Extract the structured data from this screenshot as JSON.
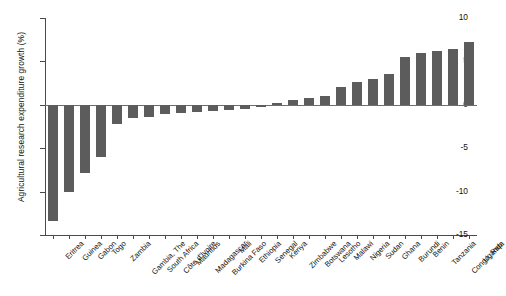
{
  "chart_data": {
    "type": "bar",
    "title": "",
    "xlabel": "",
    "ylabel": "Agricultural research expenditure growth (%)",
    "ylim": [
      -15,
      10
    ],
    "yticks": [
      10,
      5,
      0,
      -5,
      -10,
      -15
    ],
    "ytick_labels": [
      "10",
      "5",
      "0",
      "-5",
      "-10",
      "-15"
    ],
    "grid": false,
    "legend": "none",
    "bar_color": "#5c5c5c",
    "categories": [
      "Eritrea",
      "Guinea",
      "Gabon",
      "Togo",
      "Zambia",
      "Gambia, The",
      "South Africa",
      "Côte d'Ivoire",
      "Mauritius",
      "Madagascar",
      "Burkina Faso",
      "Mali",
      "Ethiopia",
      "Senegal",
      "Kenya",
      "Zimbabwe",
      "Botswana",
      "Lesotho",
      "Malawi",
      "Nigeria",
      "Sudan",
      "Ghana",
      "Burundi",
      "Benin",
      "Tanzania",
      "Congo, Rep.",
      "Uganda"
    ],
    "values": [
      -13.4,
      -10.0,
      -7.9,
      -6.0,
      -2.2,
      -1.5,
      -1.4,
      -1.1,
      -0.9,
      -0.8,
      -0.7,
      -0.6,
      -0.5,
      -0.2,
      0.2,
      0.5,
      0.8,
      1.0,
      2.1,
      2.6,
      3.0,
      3.5,
      5.5,
      6.0,
      6.2,
      6.4,
      7.2
    ]
  }
}
